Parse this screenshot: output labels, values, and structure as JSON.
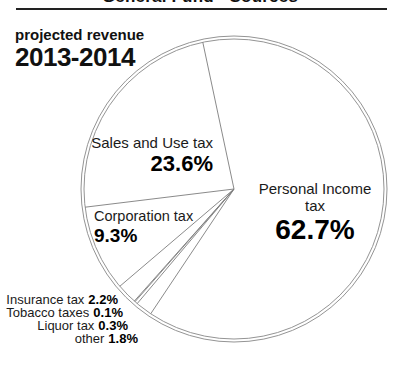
{
  "header": {
    "title": "General Fund - Sources"
  },
  "intro": {
    "line1": "projected revenue",
    "line2": "2013-2014"
  },
  "callouts": {
    "sales": {
      "name": "Sales and Use tax",
      "pct": "23.6%"
    },
    "personal": {
      "name": "Personal Income tax",
      "pct": "62.7%"
    },
    "corporation": {
      "name": "Corporation tax",
      "pct": "9.3%"
    },
    "insurance": {
      "name": "Insurance tax",
      "pct": "2.2%"
    },
    "tobacco": {
      "name": "Tobacco taxes",
      "pct": "0.1%"
    },
    "liquor": {
      "name": "Liquor tax",
      "pct": "0.3%"
    },
    "other": {
      "name": "other",
      "pct": "1.8%"
    }
  },
  "chart_data": {
    "type": "pie",
    "title": "General Fund - Sources",
    "subtitle": "projected revenue 2013-2014",
    "unit": "%",
    "slices": [
      {
        "label": "Sales and Use tax",
        "value": 23.6
      },
      {
        "label": "Corporation tax",
        "value": 9.3
      },
      {
        "label": "Insurance tax",
        "value": 2.2
      },
      {
        "label": "Tobacco taxes",
        "value": 0.1
      },
      {
        "label": "Liquor tax",
        "value": 0.3
      },
      {
        "label": "other",
        "value": 1.8
      },
      {
        "label": "Personal Income tax",
        "value": 62.7
      }
    ],
    "start_angle_deg": 102,
    "direction": "counterclockwise",
    "style": "unfilled pie, white slices, thin gray outlines, double outer rim",
    "legend_position": "labels inside and around pie"
  },
  "colors": {
    "rim": "#949494",
    "slice_line": "#7d7d7d",
    "text": "#111111",
    "rule": "#222222"
  }
}
